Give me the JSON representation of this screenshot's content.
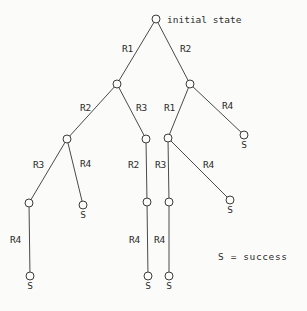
{
  "figure": {
    "title": "",
    "root_caption": "initial state",
    "legend": "S = success",
    "success_label": "S",
    "colors": {
      "background": "#fbfbf9",
      "stroke": "#4a4a4a",
      "node_stroke": "#3c3c3c",
      "node_fill": "#fbfbf9",
      "text": "#2b2b2b"
    }
  },
  "chart_data": {
    "type": "diagram",
    "subtype": "search-tree",
    "title": "",
    "legend_entries": [
      "S = success"
    ],
    "node_radius": 4,
    "nodes": [
      {
        "id": "n0",
        "x": 156,
        "y": 19,
        "label": "initial state",
        "label_pos": "right",
        "terminal": false
      },
      {
        "id": "n1",
        "x": 117,
        "y": 84,
        "label": "",
        "label_pos": "none",
        "terminal": false
      },
      {
        "id": "n2",
        "x": 190,
        "y": 84,
        "label": "",
        "label_pos": "none",
        "terminal": false
      },
      {
        "id": "n3",
        "x": 67,
        "y": 139,
        "label": "",
        "label_pos": "none",
        "terminal": false
      },
      {
        "id": "n4",
        "x": 146,
        "y": 139,
        "label": "",
        "label_pos": "none",
        "terminal": false
      },
      {
        "id": "n5",
        "x": 168,
        "y": 138,
        "label": "",
        "label_pos": "none",
        "terminal": false
      },
      {
        "id": "n6",
        "x": 244,
        "y": 135,
        "label": "S",
        "label_pos": "below",
        "terminal": true
      },
      {
        "id": "n7",
        "x": 29,
        "y": 203,
        "label": "",
        "label_pos": "none",
        "terminal": false
      },
      {
        "id": "n8",
        "x": 83,
        "y": 205,
        "label": "S",
        "label_pos": "below",
        "terminal": true
      },
      {
        "id": "n9",
        "x": 147,
        "y": 202,
        "label": "",
        "label_pos": "none",
        "terminal": false
      },
      {
        "id": "n10",
        "x": 169,
        "y": 202,
        "label": "",
        "label_pos": "none",
        "terminal": false
      },
      {
        "id": "n11",
        "x": 230,
        "y": 200,
        "label": "S",
        "label_pos": "below",
        "terminal": true
      },
      {
        "id": "n12",
        "x": 30,
        "y": 276,
        "label": "S",
        "label_pos": "below",
        "terminal": true
      },
      {
        "id": "n13",
        "x": 148,
        "y": 276,
        "label": "S",
        "label_pos": "below",
        "terminal": true
      },
      {
        "id": "n14",
        "x": 169,
        "y": 276,
        "label": "S",
        "label_pos": "below",
        "terminal": true
      }
    ],
    "edges": [
      {
        "from": "n0",
        "to": "n1",
        "rule": "R1",
        "label_x": 122,
        "label_y": 52
      },
      {
        "from": "n0",
        "to": "n2",
        "rule": "R2",
        "label_x": 180,
        "label_y": 52
      },
      {
        "from": "n1",
        "to": "n3",
        "rule": "R2",
        "label_x": 80,
        "label_y": 111
      },
      {
        "from": "n1",
        "to": "n4",
        "rule": "R3",
        "label_x": 136,
        "label_y": 111
      },
      {
        "from": "n2",
        "to": "n5",
        "rule": "R1",
        "label_x": 164,
        "label_y": 111
      },
      {
        "from": "n2",
        "to": "n6",
        "rule": "R4",
        "label_x": 222,
        "label_y": 109
      },
      {
        "from": "n3",
        "to": "n7",
        "rule": "R3",
        "label_x": 33,
        "label_y": 168
      },
      {
        "from": "n3",
        "to": "n8",
        "rule": "R4",
        "label_x": 80,
        "label_y": 167
      },
      {
        "from": "n4",
        "to": "n9",
        "rule": "R2",
        "label_x": 128,
        "label_y": 168
      },
      {
        "from": "n5",
        "to": "n10",
        "rule": "R3",
        "label_x": 155,
        "label_y": 168
      },
      {
        "from": "n5",
        "to": "n11",
        "rule": "R4",
        "label_x": 203,
        "label_y": 168
      },
      {
        "from": "n7",
        "to": "n12",
        "rule": "R4",
        "label_x": 10,
        "label_y": 243
      },
      {
        "from": "n9",
        "to": "n13",
        "rule": "R4",
        "label_x": 129,
        "label_y": 243
      },
      {
        "from": "n10",
        "to": "n14",
        "rule": "R4",
        "label_x": 154,
        "label_y": 243
      }
    ],
    "annotations": [
      {
        "text": "initial state",
        "x": 167,
        "y": 23,
        "anchor": "start"
      },
      {
        "text": "S = success",
        "x": 218,
        "y": 260,
        "anchor": "start"
      }
    ]
  }
}
